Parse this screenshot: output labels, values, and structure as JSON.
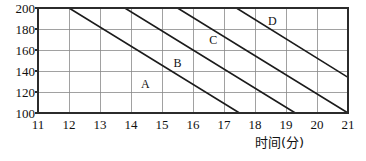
{
  "chart_data": {
    "type": "line",
    "title": "",
    "subtitle": "",
    "xlabel": "时间(分)",
    "ylabel": "",
    "xlim": [
      11,
      21
    ],
    "ylim": [
      100,
      200
    ],
    "xticks": [
      11,
      12,
      13,
      14,
      15,
      16,
      17,
      18,
      19,
      20,
      21
    ],
    "yticks": [
      100,
      120,
      140,
      160,
      180,
      200
    ],
    "xtick_labels": [
      "11",
      "12",
      "13",
      "14",
      "15",
      "16",
      "17",
      "18",
      "19",
      "20",
      "21"
    ],
    "ytick_labels": [
      "100",
      "120",
      "140",
      "160",
      "180",
      "200"
    ],
    "grid": true,
    "legend": "none",
    "line_color": "#1b1b1b",
    "grid_color": "#8a8a8a",
    "frame_color": "#2b2b2b",
    "background": "#ffffff",
    "series": [
      {
        "name": "A",
        "label": "A",
        "label_x": 14.45,
        "label_y": 128,
        "points": [
          {
            "x": 12.0,
            "y": 200
          },
          {
            "x": 17.5,
            "y": 100
          }
        ]
      },
      {
        "name": "B",
        "label": "B",
        "label_x": 15.5,
        "label_y": 148,
        "points": [
          {
            "x": 13.8,
            "y": 200
          },
          {
            "x": 19.3,
            "y": 100
          }
        ]
      },
      {
        "name": "C",
        "label": "C",
        "label_x": 16.65,
        "label_y": 170,
        "points": [
          {
            "x": 15.5,
            "y": 200
          },
          {
            "x": 21.0,
            "y": 100
          }
        ]
      },
      {
        "name": "D",
        "label": "D",
        "label_x": 18.55,
        "label_y": 188,
        "points": [
          {
            "x": 17.4,
            "y": 200
          },
          {
            "x": 21.0,
            "y": 134
          }
        ]
      }
    ]
  },
  "axis": {
    "x_title": "时间(分)"
  }
}
